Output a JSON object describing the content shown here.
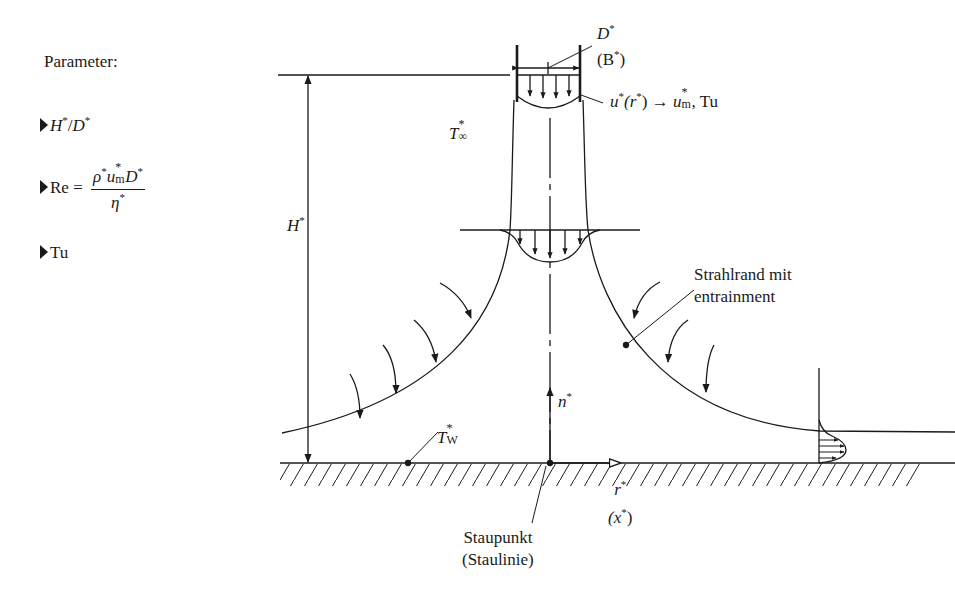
{
  "parameters": {
    "heading": "Parameter:",
    "items": [
      {
        "id": "ratio",
        "lhs": "H",
        "sep": "/",
        "rhs": "D",
        "star": "*"
      },
      {
        "id": "reynolds",
        "lhs": "Re",
        "eq": "=",
        "num_a": "ρ",
        "num_b": "u",
        "num_b_sub": "m",
        "num_c": "D",
        "den": "η",
        "star": "*"
      },
      {
        "id": "turbulence",
        "label": "Tu"
      }
    ]
  },
  "labels": {
    "nozzle_width": {
      "main": "D",
      "alt": "(B",
      "alt_close": ")",
      "star": "*"
    },
    "inlet_profile": {
      "u": "u",
      "r": "(r",
      "close": ")",
      "arrow": "→",
      "um": "u",
      "um_sub": "m",
      "tail": ", Tu",
      "star": "*"
    },
    "ambient_temp": {
      "sym": "T",
      "sub": "∞",
      "star": "*"
    },
    "height": {
      "sym": "H",
      "star": "*"
    },
    "jet_edge": {
      "line1": "Strahlrand mit",
      "line2": "entrainment"
    },
    "normal_coord": {
      "sym": "n",
      "star": "*"
    },
    "wall_temp": {
      "sym": "T",
      "sub": "W",
      "star": "*"
    },
    "radial_coord": {
      "sym": "r",
      "alt": "(x",
      "close": ")",
      "star": "*"
    },
    "stagnation": {
      "line1": "Staupunkt",
      "line2": "(Staulinie)"
    }
  },
  "colors": {
    "ink": "#1a1a1a",
    "background": "#ffffff"
  }
}
